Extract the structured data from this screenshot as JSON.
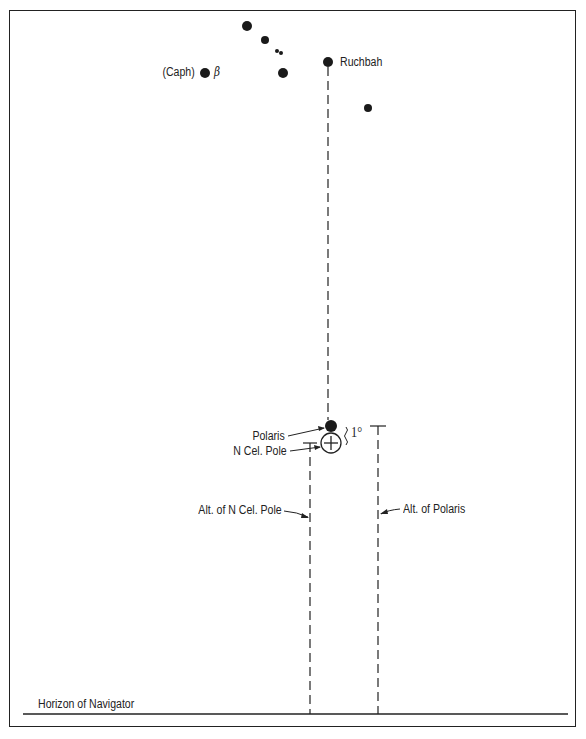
{
  "diagram": {
    "stars": [
      {
        "name": "Caph",
        "label": "(Caph)",
        "greek": "β",
        "x": 205,
        "y": 73,
        "r": 5
      },
      {
        "name": "star-top",
        "x": 247,
        "y": 26,
        "r": 5
      },
      {
        "name": "star-2",
        "x": 265,
        "y": 40,
        "r": 4
      },
      {
        "name": "star-double-a",
        "x": 277,
        "y": 51,
        "r": 2
      },
      {
        "name": "star-double-b",
        "x": 281,
        "y": 53,
        "r": 2
      },
      {
        "name": "star-3",
        "x": 283,
        "y": 73,
        "r": 5
      },
      {
        "name": "Ruchbah",
        "label": "Ruchbah",
        "x": 328,
        "y": 62,
        "r": 5
      },
      {
        "name": "star-right",
        "x": 368,
        "y": 108,
        "r": 4
      },
      {
        "name": "Polaris",
        "x": 331,
        "y": 426,
        "r": 6
      }
    ],
    "labels": {
      "caph": "(Caph)",
      "beta": "β",
      "ruchbah": "Ruchbah",
      "polaris": "Polaris",
      "n_cel_pole": "N Cel. Pole",
      "one_degree": "1°",
      "alt_n_cel_pole": "Alt. of N Cel. Pole",
      "alt_polaris": "Alt. of Polaris",
      "horizon": "Horizon of Navigator"
    },
    "colors": {
      "ink": "#222222",
      "background": "#ffffff"
    }
  }
}
